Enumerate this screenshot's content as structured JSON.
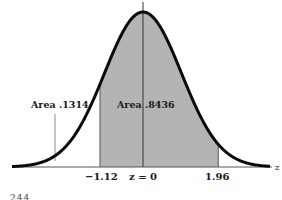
{
  "figure": {
    "labels": {
      "left_area": "Area .1314",
      "center_area": "Area .8436",
      "axis_end": "z"
    },
    "ticks": [
      {
        "label": "−1.12",
        "z": -1.12
      },
      {
        "label": "z = 0",
        "z": 0
      },
      {
        "label": "1.96",
        "z": 1.96
      }
    ],
    "partial_footer_text": "244",
    "colors": {
      "curve": "#0a0a0a",
      "shade": "#b4b4b4",
      "axis": "#555555",
      "marker": "#8a8a8a"
    }
  },
  "chart_data": {
    "type": "area",
    "title": "",
    "xlabel": "z",
    "ylabel": "",
    "distribution": "standard normal",
    "shaded_interval": [
      -1.12,
      1.96
    ],
    "annotations": [
      {
        "text": "Area .1314",
        "region": "left tail z < -1.12"
      },
      {
        "text": "Area .8436",
        "region": "-1.12 < z < 1.96"
      }
    ],
    "x_ticks": [
      "-1.12",
      "z = 0",
      "1.96"
    ],
    "xlim": [
      -3.4,
      3.4
    ],
    "grid": false
  }
}
